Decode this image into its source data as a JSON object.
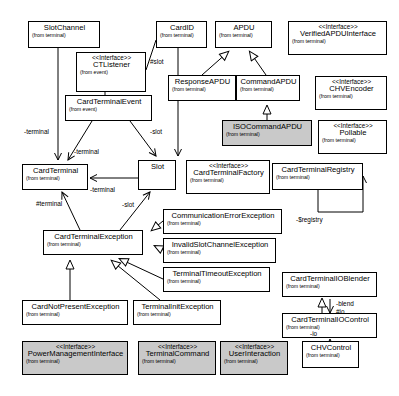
{
  "diagram": {
    "type": "uml-class-diagram",
    "stereotype_interface": "<<Interface>>",
    "colors": {
      "shaded_fill": "#c9c9c9",
      "plain_fill": "#ffffff",
      "line": "#000000"
    }
  },
  "nodes": [
    {
      "id": "slotchannel",
      "name": "SlotChannel",
      "package": "(from terminal)",
      "stereotype": "",
      "shaded": false,
      "x": 28,
      "y": 21,
      "w": 72,
      "h": 27
    },
    {
      "id": "cardid",
      "name": "CardID",
      "package": "(from terminal)",
      "stereotype": "",
      "shaded": false,
      "x": 156,
      "y": 21,
      "w": 51,
      "h": 27
    },
    {
      "id": "apdu",
      "name": "APDU",
      "package": "(from terminal)",
      "stereotype": "",
      "shaded": false,
      "x": 215,
      "y": 21,
      "w": 57,
      "h": 27
    },
    {
      "id": "verifiedapdu",
      "name": "VerifiedAPDUInterface",
      "package": "(from terminal)",
      "stereotype": "<<Interface>>",
      "shaded": false,
      "x": 288,
      "y": 21,
      "w": 99,
      "h": 34
    },
    {
      "id": "ctlistener",
      "name": "CTListener",
      "package": "(from event)",
      "stereotype": "<<Interface>>",
      "shaded": false,
      "x": 76,
      "y": 52,
      "w": 70,
      "h": 40
    },
    {
      "id": "responseapdu",
      "name": "ResponseAPDU",
      "package": "(from terminal)",
      "stereotype": "",
      "shaded": false,
      "x": 168,
      "y": 75,
      "w": 68,
      "h": 26
    },
    {
      "id": "commandapdu",
      "name": "CommandAPDU",
      "package": "(from terminal)",
      "stereotype": "",
      "shaded": false,
      "x": 236,
      "y": 75,
      "w": 64,
      "h": 26
    },
    {
      "id": "chvencoder",
      "name": "CHVEncoder",
      "package": "(from terminal)",
      "stereotype": "<<Interface>>",
      "shaded": false,
      "x": 315,
      "y": 76,
      "w": 72,
      "h": 34
    },
    {
      "id": "cardterminalevent",
      "name": "CardTerminalEvent",
      "package": "(from event)",
      "stereotype": "",
      "shaded": false,
      "x": 65,
      "y": 95,
      "w": 87,
      "h": 26
    },
    {
      "id": "isocommandapdu",
      "name": "ISOCommandAPDU",
      "package": "(from terminal)",
      "stereotype": "",
      "shaded": true,
      "x": 222,
      "y": 120,
      "w": 90,
      "h": 26
    },
    {
      "id": "pollable",
      "name": "Pollable",
      "package": "(from terminal)",
      "stereotype": "<<Interface>>",
      "shaded": false,
      "x": 318,
      "y": 120,
      "w": 69,
      "h": 34
    },
    {
      "id": "cardterminal",
      "name": "CardTerminal",
      "package": "(from terminal)",
      "stereotype": "",
      "shaded": false,
      "x": 22,
      "y": 164,
      "w": 66,
      "h": 26
    },
    {
      "id": "slot",
      "name": "Slot",
      "package": "",
      "stereotype": "",
      "shaded": false,
      "x": 138,
      "y": 160,
      "w": 38,
      "h": 30
    },
    {
      "id": "cardterminalfactory",
      "name": "CardTerminalFactory",
      "package": "(from terminal)",
      "stereotype": "<<Interface>>",
      "shaded": false,
      "x": 186,
      "y": 160,
      "w": 84,
      "h": 34
    },
    {
      "id": "cardterminalregistry",
      "name": "CardTerminalRegistry",
      "package": "(from terminal)",
      "stereotype": "",
      "shaded": false,
      "x": 272,
      "y": 163,
      "w": 91,
      "h": 27
    },
    {
      "id": "commerror",
      "name": "CommunicationErrorException",
      "package": "(from terminal)",
      "stereotype": "",
      "shaded": false,
      "x": 163,
      "y": 209,
      "w": 119,
      "h": 25
    },
    {
      "id": "invalidslot",
      "name": "InvalidSlotChannelException",
      "package": "(from terminal)",
      "stereotype": "",
      "shaded": false,
      "x": 163,
      "y": 238,
      "w": 113,
      "h": 25
    },
    {
      "id": "cardterminalexception",
      "name": "CardTerminalException",
      "package": "(from terminal)",
      "stereotype": "",
      "shaded": false,
      "x": 43,
      "y": 230,
      "w": 100,
      "h": 25
    },
    {
      "id": "terminaltimeout",
      "name": "TerminalTimeoutException",
      "package": "(from terminal)",
      "stereotype": "",
      "shaded": false,
      "x": 163,
      "y": 267,
      "w": 107,
      "h": 25
    },
    {
      "id": "ioblender",
      "name": "CardTerminalIOBlender",
      "package": "(from terminal)",
      "stereotype": "",
      "shaded": false,
      "x": 282,
      "y": 272,
      "w": 95,
      "h": 25
    },
    {
      "id": "cardnotpresent",
      "name": "CardNotPresentException",
      "package": "(from terminal)",
      "stereotype": "",
      "shaded": false,
      "x": 22,
      "y": 300,
      "w": 106,
      "h": 25
    },
    {
      "id": "terminalinit",
      "name": "TerminalInitException",
      "package": "(from terminal)",
      "stereotype": "",
      "shaded": false,
      "x": 133,
      "y": 300,
      "w": 88,
      "h": 25
    },
    {
      "id": "iocontrol",
      "name": "CardTerminalIOControl",
      "package": "(from terminal)",
      "stereotype": "",
      "shaded": false,
      "x": 282,
      "y": 313,
      "w": 95,
      "h": 25
    },
    {
      "id": "powermgmt",
      "name": "PowerManagementInterface",
      "package": "(from terminal)",
      "stereotype": "<<Interface>>",
      "shaded": true,
      "x": 22,
      "y": 341,
      "w": 106,
      "h": 34
    },
    {
      "id": "terminalcommand",
      "name": "TerminalCommand",
      "package": "(from terminal)",
      "stereotype": "<<Interface>>",
      "shaded": true,
      "x": 138,
      "y": 341,
      "w": 78,
      "h": 34
    },
    {
      "id": "userinteraction",
      "name": "UserInteraction",
      "package": "(from terminal)",
      "stereotype": "<<Interface>>",
      "shaded": true,
      "x": 220,
      "y": 341,
      "w": 68,
      "h": 34
    },
    {
      "id": "chvcontrol",
      "name": "CHVControl",
      "package": "(from terminal)",
      "stereotype": "",
      "shaded": false,
      "x": 302,
      "y": 341,
      "w": 57,
      "h": 27
    }
  ],
  "edge_labels": [
    {
      "id": "slot-role-ctlistener",
      "text": "#slot",
      "x": 150,
      "y": 58
    },
    {
      "id": "terminal-left",
      "text": "-terminal",
      "x": 24,
      "y": 128
    },
    {
      "id": "terminal-mid",
      "text": "-terminal",
      "x": 74,
      "y": 148
    },
    {
      "id": "slot-right",
      "text": "-slot",
      "x": 150,
      "y": 128
    },
    {
      "id": "terminal-slot-assoc",
      "text": "-terminal",
      "x": 90,
      "y": 186
    },
    {
      "id": "terminal-attr",
      "text": "#terminal",
      "x": 36,
      "y": 200
    },
    {
      "id": "slot-attr",
      "text": "-slot",
      "x": 122,
      "y": 201
    },
    {
      "id": "registry-self",
      "text": "-$registry",
      "x": 296,
      "y": 216
    },
    {
      "id": "blend-role",
      "text": "-blend",
      "x": 336,
      "y": 300
    },
    {
      "id": "io-role",
      "text": "#io",
      "x": 336,
      "y": 308
    },
    {
      "id": "io-role-2",
      "text": "-io",
      "x": 310,
      "y": 330
    }
  ]
}
